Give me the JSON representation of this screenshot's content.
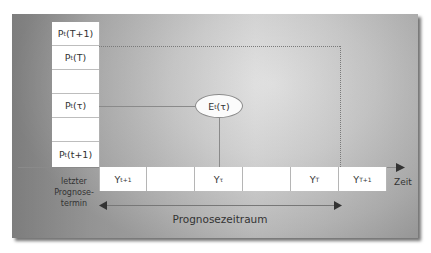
{
  "diagram": {
    "forecast_column": {
      "cells": [
        {
          "base": "P",
          "sub": "t",
          "arg": "(T+1)"
        },
        {
          "base": "P",
          "sub": "t",
          "arg": "(T)"
        },
        {
          "base": "",
          "sub": "",
          "arg": ""
        },
        {
          "base": "P",
          "sub": "t",
          "arg": "(τ)"
        },
        {
          "base": "",
          "sub": "",
          "arg": ""
        },
        {
          "base": "P",
          "sub": "t",
          "arg": "(t+1)"
        }
      ]
    },
    "timeline": {
      "boxes": [
        {
          "base": "Y",
          "sub": "t+1"
        },
        {
          "base": "",
          "sub": ""
        },
        {
          "base": "Y",
          "sub": "τ"
        },
        {
          "base": "",
          "sub": ""
        },
        {
          "base": "Y",
          "sub": "T"
        },
        {
          "base": "Y",
          "sub": "T+1"
        }
      ],
      "axis_label": "Zeit"
    },
    "estimate_node": {
      "base": "E",
      "sub": "t",
      "arg": "(τ)"
    },
    "last_forecast_label": [
      "letzter",
      "Prognose-",
      "termin"
    ],
    "span_label": "Prognosezeitraum",
    "colors": {
      "line": "#8a8a8a",
      "box_fill": "#ffffff",
      "panel_shadow": "#555555"
    }
  }
}
